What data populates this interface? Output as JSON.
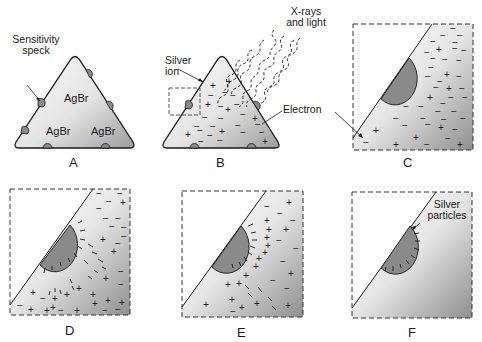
{
  "figure": {
    "panels": [
      {
        "id": "A",
        "label": "A",
        "crystal_labels": [
          "AgBr",
          "AgBr",
          "AgBr"
        ],
        "annotations": [
          "Sensitivity\nspeck"
        ]
      },
      {
        "id": "B",
        "label": "B",
        "annotations": [
          "Silver\nion",
          "X-rays\nand light",
          "Electron"
        ]
      },
      {
        "id": "C",
        "label": "C"
      },
      {
        "id": "D",
        "label": "D"
      },
      {
        "id": "E",
        "label": "E"
      },
      {
        "id": "F",
        "label": "F",
        "annotations": [
          "Silver\nparticles"
        ]
      }
    ]
  },
  "labels": {
    "a": {
      "panel": "A",
      "sensitivity_speck": "Sensitivity\nspeck",
      "agbr_top": "AgBr",
      "agbr_left": "AgBr",
      "agbr_right": "AgBr"
    },
    "b": {
      "panel": "B",
      "silver_ion": "Silver\nion",
      "xrays": "X-rays\nand light",
      "electron": "Electron"
    },
    "c": {
      "panel": "C"
    },
    "d": {
      "panel": "D"
    },
    "e": {
      "panel": "E"
    },
    "f": {
      "panel": "F",
      "silver_particles": "Silver\nparticles"
    }
  },
  "colors": {
    "crystal_light": "#f6f6f6",
    "crystal_dark": "#9a9a9a",
    "speck": "#8a8a8a",
    "stroke": "#1a1a1a"
  }
}
